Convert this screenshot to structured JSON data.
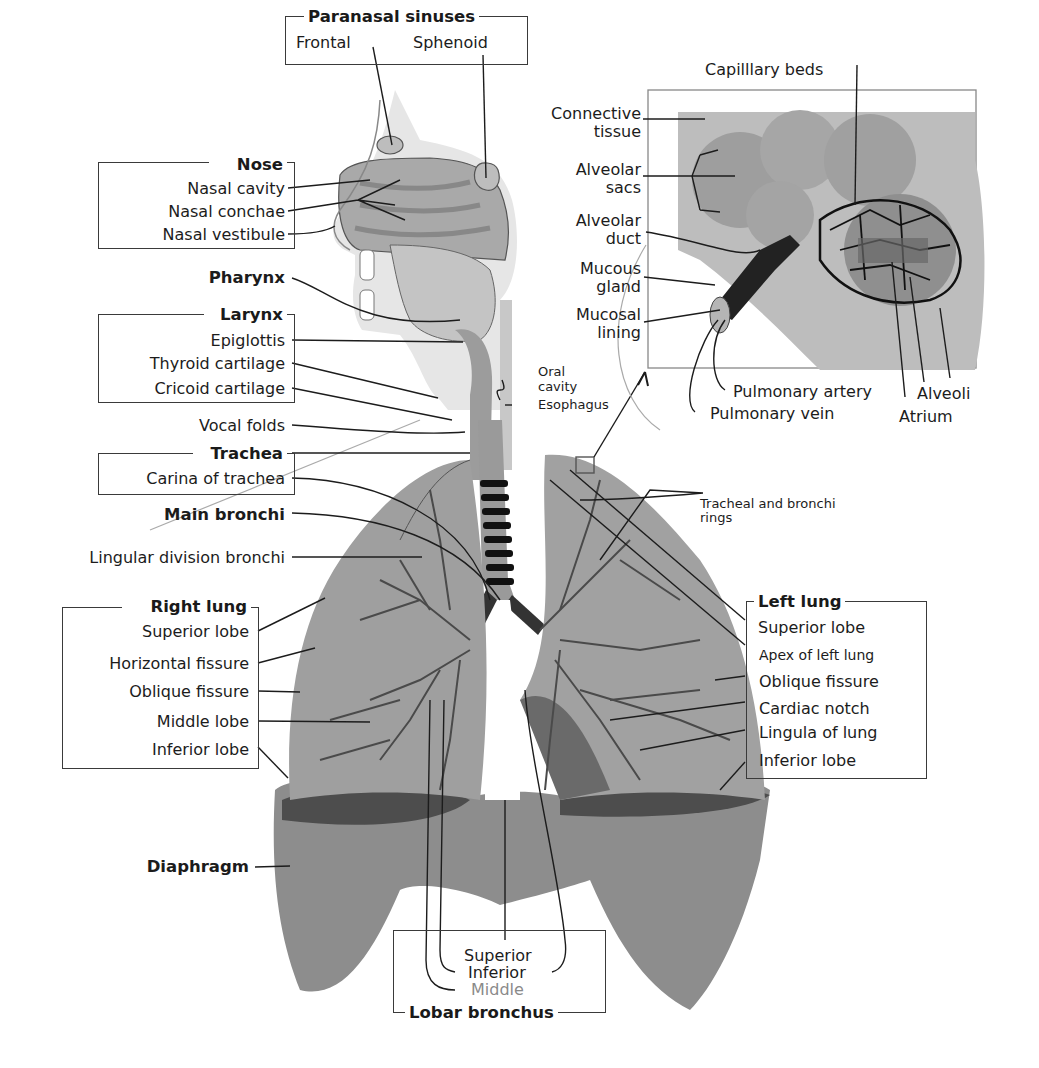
{
  "diagram": {
    "groups": {
      "paranasal_sinuses": {
        "heading": "Paranasal sinuses",
        "items": [
          "Frontal",
          "Sphenoid"
        ]
      },
      "nose": {
        "heading": "Nose",
        "items": [
          "Nasal cavity",
          "Nasal conchae",
          "Nasal vestibule"
        ]
      },
      "pharynx": {
        "heading": "Pharynx"
      },
      "larynx": {
        "heading": "Larynx",
        "items": [
          "Epiglottis",
          "Thyroid cartilage",
          "Cricoid cartilage"
        ]
      },
      "vocal_folds": {
        "label": "Vocal folds"
      },
      "trachea": {
        "heading": "Trachea",
        "items": [
          "Carina of trachea"
        ]
      },
      "main_bronchi": {
        "heading": "Main bronchi"
      },
      "lingular": {
        "label": "Lingular division bronchi"
      },
      "right_lung": {
        "heading": "Right lung",
        "items": [
          "Superior lobe",
          "Horizontal fissure",
          "Oblique fissure",
          "Middle lobe",
          "Inferior lobe"
        ]
      },
      "diaphragm": {
        "heading": "Diaphragm"
      },
      "left_lung": {
        "heading": "Left lung",
        "items": [
          "Superior lobe",
          "Apex of left lung",
          "Oblique fissure",
          "Cardiac notch",
          "Lingula of lung",
          "Inferior lobe"
        ]
      },
      "lobar_bronchus": {
        "heading": "Lobar bronchus",
        "items": [
          "Superior",
          "Inferior",
          "Middle"
        ]
      },
      "oral_cavity": {
        "line1": "Oral",
        "line2": "cavity"
      },
      "esophagus": {
        "label": "Esophagus"
      },
      "rings": {
        "line1": "Tracheal and bronchi",
        "line2": "rings"
      }
    },
    "inset": {
      "capillary_beds": "Capilllary beds",
      "connective_tissue": {
        "line1": "Connective",
        "line2": "tissue"
      },
      "alveolar_sacs": {
        "line1": "Alveolar",
        "line2": "sacs"
      },
      "alveolar_duct": {
        "line1": "Alveolar",
        "line2": "duct"
      },
      "mucous_gland": {
        "line1": "Mucous",
        "line2": "gland"
      },
      "mucosal_lining": {
        "line1": "Mucosal",
        "line2": "lining"
      },
      "pulmonary_artery": "Pulmonary artery",
      "pulmonary_vein": "Pulmonary vein",
      "alveoli": "Alveoli",
      "atrium": "Atrium"
    },
    "colors": {
      "tissue_light": "#cfcfcf",
      "tissue_mid": "#9a9a9a",
      "tissue_dark": "#5e5e5e",
      "line": "#1c1c1c",
      "box": "#3a3a3a"
    }
  }
}
